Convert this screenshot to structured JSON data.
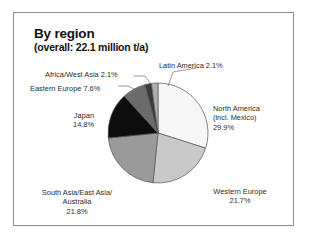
{
  "figure": {
    "title": "By region",
    "subtitle": "(overall: 22.1 million t/a)"
  },
  "labels": {
    "north_america": {
      "line1": "North America",
      "line2": "(incl. Mexico)",
      "line3": "29.9%"
    },
    "western_europe": {
      "line1": "Western Europe",
      "line2": "21.7%"
    },
    "south_asia": {
      "line1": "South Asia/East Asia/",
      "line2": "Australia",
      "line3": "21.8%"
    },
    "japan": {
      "line1": "Japan",
      "line2": "14.8%"
    },
    "eastern_europe": {
      "line1": "Eastern Europe 7.6%"
    },
    "africa_west_asia": {
      "line1": "Africa/West Asia 2.1%"
    },
    "latin_america": {
      "line1": "Latin America 2.1%"
    }
  },
  "chart_data": {
    "type": "pie",
    "title": "By region",
    "subtitle": "(overall: 22.1 million t/a)",
    "total_label": "overall: 22.1 million t/a",
    "total_value": 22.1,
    "units": "million t/a",
    "start_angle_deg": 0,
    "direction": "clockwise",
    "legend": "none (direct labels with leader lines)",
    "grid": false,
    "categories": [
      "North America (incl. Mexico)",
      "Western Europe",
      "South Asia/East Asia/Australia",
      "Japan",
      "Eastern Europe",
      "Africa/West Asia",
      "Latin America"
    ],
    "values": [
      29.9,
      21.7,
      21.8,
      14.8,
      7.6,
      2.1,
      2.1
    ],
    "colors": [
      "#f7f7f7",
      "#c9c9c9",
      "#9a9a9a",
      "#0d0d0d",
      "#6b6b6b",
      "#3a3a3a",
      "#b0b0b0"
    ],
    "slices": [
      {
        "label": "North America (incl. Mexico)",
        "value": 29.9,
        "color": "#f7f7f7"
      },
      {
        "label": "Western Europe",
        "value": 21.7,
        "color": "#c9c9c9"
      },
      {
        "label": "South Asia/East Asia/Australia",
        "value": 21.8,
        "color": "#9a9a9a"
      },
      {
        "label": "Japan",
        "value": 14.8,
        "color": "#0d0d0d"
      },
      {
        "label": "Eastern Europe",
        "value": 7.6,
        "color": "#6b6b6b"
      },
      {
        "label": "Africa/West Asia",
        "value": 2.1,
        "color": "#3a3a3a"
      },
      {
        "label": "Latin America",
        "value": 2.1,
        "color": "#b0b0b0"
      }
    ]
  }
}
